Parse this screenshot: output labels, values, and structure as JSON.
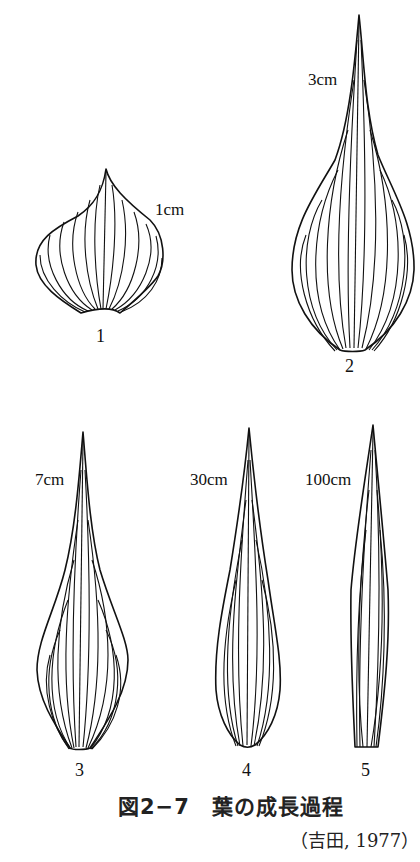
{
  "figure": {
    "caption": "図2−7　葉の成長過程",
    "source": "（吉田, 1977）",
    "leaves": [
      {
        "number": "1",
        "size_label": "1cm"
      },
      {
        "number": "2",
        "size_label": "3cm"
      },
      {
        "number": "3",
        "size_label": "7cm"
      },
      {
        "number": "4",
        "size_label": "30cm"
      },
      {
        "number": "5",
        "size_label": "100cm"
      }
    ]
  }
}
